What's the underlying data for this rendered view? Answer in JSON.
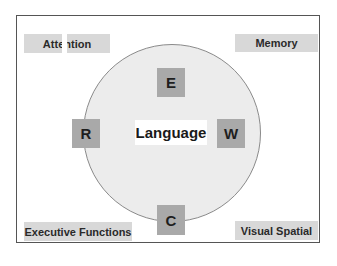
{
  "diagram": {
    "center": {
      "label": "Language"
    },
    "letters": [
      {
        "id": "E",
        "label": "E",
        "position": "top"
      },
      {
        "id": "R",
        "label": "R",
        "position": "left"
      },
      {
        "id": "W",
        "label": "W",
        "position": "right"
      },
      {
        "id": "C",
        "label": "C",
        "position": "bottom"
      }
    ],
    "corners": {
      "top_left": "Attention",
      "top_right": "Memory",
      "bottom_left": "Executive Functions",
      "bottom_right": "Visual Spatial"
    },
    "colors": {
      "frame_border": "#555555",
      "circle_fill": "#ececec",
      "circle_border": "#8a8a8a",
      "letter_box": "#a9a9a9",
      "label_box": "#d8d8d8"
    }
  }
}
